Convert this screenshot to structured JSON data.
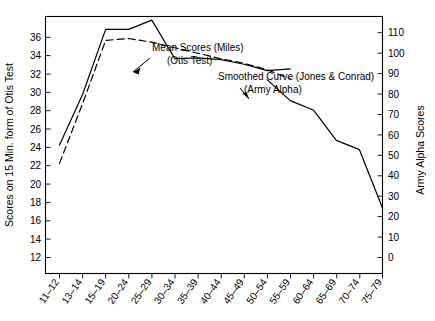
{
  "chart_data": {
    "type": "line",
    "title": "",
    "xlabel": "",
    "ylabel": "Scores on 15 Min. form of Otis Test",
    "ylabel_right": "Army Alpha Scores",
    "grid": false,
    "legend_position": "inline-annotations",
    "categories": [
      "11–12",
      "13–14",
      "15–19",
      "20–24",
      "25–29",
      "30–34",
      "35–39",
      "40–44",
      "45–49",
      "50–54",
      "55–59",
      "60–64",
      "65–69",
      "70–74",
      "75–79"
    ],
    "ylim": [
      12,
      40
    ],
    "yticks": [
      12,
      14,
      16,
      18,
      20,
      22,
      24,
      26,
      28,
      30,
      32,
      34,
      36,
      38,
      40
    ],
    "ylim_right": [
      0,
      110
    ],
    "yticks_right": [
      0,
      10,
      20,
      30,
      40,
      50,
      60,
      70,
      80,
      90,
      100,
      110
    ],
    "series": [
      {
        "name": "Mean Scores (Miles) (Otis Test)",
        "style": "solid",
        "axis": "left",
        "values": [
          26.0,
          31.5,
          38.6,
          38.6,
          39.6,
          35.4,
          35.5,
          35.3,
          34.8,
          34.1,
          34.3,
          null,
          null,
          null,
          null
        ]
      },
      {
        "name": "Smoothed Curve (Jones & Conrad) (Army Alpha)",
        "style": "dashed",
        "axis": "left",
        "values": [
          24.0,
          30.5,
          37.4,
          37.6,
          37.2,
          36.6,
          36.0,
          35.4,
          34.9,
          34.2,
          33.2,
          null,
          null,
          null,
          null
        ]
      },
      {
        "name": "Army Alpha decline",
        "style": "solid",
        "axis": "right",
        "values": [
          null,
          null,
          null,
          null,
          null,
          null,
          null,
          null,
          null,
          83.0,
          74.0,
          70.0,
          57.0,
          53.0,
          28.0
        ]
      }
    ],
    "annotations": [
      {
        "id": "annotation-mean-scores",
        "line1": "Mean Scores (Miles)",
        "line2": "(Otis Test)"
      },
      {
        "id": "annotation-smoothed-curve",
        "line1": "Smoothed Curve (Jones & Conrad)",
        "line2": "(Army Alpha)"
      }
    ]
  }
}
